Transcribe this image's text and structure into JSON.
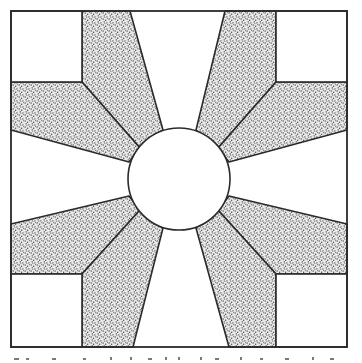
{
  "figure": {
    "type": "quilt-block-diagram",
    "colors": {
      "background": "#ffffff",
      "stroke": "#2b2b2b",
      "stipple_dot": "#3a3a3a"
    },
    "geometry": {
      "outer_square": [
        11,
        11,
        347,
        347
      ],
      "inner_corner_squares": [
        [
          11,
          11,
          82,
          82
        ],
        [
          276,
          11,
          347,
          82
        ],
        [
          11,
          274,
          82,
          347
        ],
        [
          276,
          274,
          347,
          347
        ]
      ],
      "circle": {
        "cx": 179,
        "cy": 179,
        "r": 51
      }
    },
    "caption_partial": ""
  }
}
